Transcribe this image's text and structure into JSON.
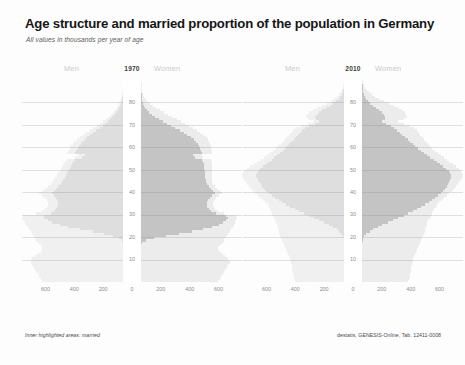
{
  "header": {
    "title": "Age structure and married proportion of the population in Germany",
    "subtitle": "All values in thousands per year of age"
  },
  "footer": {
    "left": "Inner highlighted areas: married",
    "right": "destatis, GENESIS-Online, Tab. 12411-0008"
  },
  "labels": {
    "men": "Men",
    "women": "Women"
  },
  "colors": {
    "total": "#ececec",
    "married": "#c4c4c4",
    "background": "#fdfdfd",
    "title": "#161616",
    "axis_text": "#8e8e8e",
    "header_text": "#c9c9c9"
  },
  "chart_data": [
    {
      "type": "bar",
      "title": "1970",
      "panel": "left",
      "orientation": "population-pyramid",
      "xlabel": "",
      "ylabel": "",
      "xlim": [
        -700,
        700
      ],
      "ylim": [
        0,
        90
      ],
      "grid": true,
      "legend_position": "top",
      "xticks": [
        "600",
        "400",
        "200",
        "0",
        "200",
        "400",
        "600"
      ],
      "xtick_values": [
        -600,
        -400,
        -200,
        0,
        200,
        400,
        600
      ],
      "yticks": [
        "10",
        "20",
        "30",
        "40",
        "50",
        "60",
        "70",
        "80"
      ],
      "ytick_values": [
        10,
        20,
        30,
        40,
        50,
        60,
        70,
        80
      ],
      "series": [
        {
          "name": "Men total",
          "side": "left",
          "values": [
            560,
            570,
            580,
            590,
            600,
            610,
            620,
            630,
            640,
            640,
            630,
            610,
            590,
            570,
            560,
            560,
            570,
            590,
            600,
            610,
            620,
            630,
            640,
            650,
            660,
            670,
            680,
            690,
            700,
            690,
            600,
            560,
            540,
            530,
            520,
            520,
            530,
            540,
            560,
            580,
            560,
            540,
            520,
            500,
            490,
            480,
            470,
            460,
            450,
            440,
            430,
            420,
            410,
            400,
            390,
            330,
            310,
            390,
            380,
            370,
            360,
            350,
            340,
            320,
            300,
            280,
            255,
            230,
            205,
            180,
            160,
            140,
            120,
            100,
            85,
            70,
            56,
            44,
            34,
            26,
            19,
            14,
            10,
            7,
            5,
            3,
            2,
            1,
            1,
            0
          ]
        },
        {
          "name": "Men married",
          "side": "left",
          "values": [
            0,
            0,
            0,
            0,
            0,
            0,
            0,
            0,
            0,
            0,
            0,
            0,
            0,
            0,
            0,
            0,
            0,
            2,
            10,
            30,
            70,
            130,
            210,
            300,
            380,
            440,
            490,
            520,
            545,
            550,
            500,
            480,
            465,
            455,
            450,
            450,
            458,
            465,
            480,
            495,
            480,
            465,
            450,
            432,
            422,
            414,
            405,
            396,
            387,
            378,
            370,
            362,
            353,
            344,
            336,
            284,
            266,
            334,
            324,
            314,
            304,
            294,
            284,
            266,
            248,
            230,
            206,
            184,
            161,
            140,
            123,
            106,
            89,
            73,
            60,
            48,
            37,
            28,
            21,
            15,
            10,
            7,
            5,
            3,
            2,
            1,
            1,
            0,
            0,
            0
          ]
        },
        {
          "name": "Women total",
          "side": "right",
          "values": [
            535,
            545,
            555,
            565,
            575,
            585,
            595,
            605,
            615,
            615,
            605,
            585,
            565,
            545,
            535,
            535,
            545,
            565,
            575,
            585,
            595,
            605,
            615,
            625,
            635,
            645,
            650,
            660,
            665,
            655,
            575,
            535,
            515,
            505,
            500,
            500,
            510,
            520,
            540,
            560,
            545,
            530,
            515,
            500,
            495,
            492,
            490,
            490,
            490,
            490,
            490,
            490,
            490,
            490,
            488,
            430,
            420,
            495,
            492,
            488,
            484,
            480,
            474,
            462,
            448,
            432,
            410,
            386,
            360,
            332,
            305,
            277,
            248,
            218,
            190,
            160,
            132,
            106,
            82,
            62,
            45,
            32,
            22,
            14,
            9,
            6,
            3,
            2,
            1,
            0
          ]
        },
        {
          "name": "Women married",
          "side": "right",
          "values": [
            0,
            0,
            0,
            0,
            0,
            0,
            0,
            0,
            0,
            0,
            0,
            0,
            0,
            0,
            0,
            0,
            0,
            8,
            35,
            90,
            170,
            260,
            350,
            430,
            490,
            540,
            570,
            590,
            600,
            592,
            520,
            485,
            468,
            460,
            456,
            457,
            466,
            476,
            494,
            512,
            498,
            484,
            470,
            456,
            451,
            448,
            446,
            445,
            444,
            442,
            440,
            437,
            434,
            430,
            425,
            372,
            361,
            423,
            417,
            410,
            402,
            394,
            384,
            366,
            346,
            322,
            296,
            268,
            238,
            208,
            180,
            152,
            126,
            100,
            78,
            58,
            40,
            27,
            18,
            11,
            7,
            4,
            2,
            1,
            0,
            0,
            0,
            0,
            0,
            0
          ]
        }
      ]
    },
    {
      "type": "bar",
      "title": "2010",
      "panel": "right",
      "orientation": "population-pyramid",
      "xlabel": "",
      "ylabel": "",
      "xlim": [
        -700,
        700
      ],
      "ylim": [
        0,
        90
      ],
      "grid": true,
      "legend_position": "top",
      "xticks": [
        "600",
        "400",
        "200",
        "0",
        "200",
        "400",
        "600"
      ],
      "xtick_values": [
        -600,
        -400,
        -200,
        0,
        200,
        400,
        600
      ],
      "yticks": [
        "10",
        "20",
        "30",
        "40",
        "50",
        "60",
        "70",
        "80"
      ],
      "ytick_values": [
        10,
        20,
        30,
        40,
        50,
        60,
        70,
        80
      ],
      "series": [
        {
          "name": "Men total",
          "side": "left",
          "values": [
            340,
            345,
            350,
            352,
            355,
            358,
            360,
            362,
            365,
            368,
            372,
            378,
            385,
            392,
            400,
            408,
            415,
            422,
            430,
            436,
            442,
            448,
            452,
            455,
            458,
            462,
            468,
            475,
            482,
            490,
            498,
            505,
            512,
            520,
            530,
            545,
            560,
            578,
            596,
            614,
            632,
            648,
            660,
            672,
            682,
            690,
            700,
            705,
            700,
            690,
            672,
            650,
            625,
            600,
            578,
            556,
            534,
            512,
            490,
            470,
            455,
            440,
            425,
            410,
            396,
            382,
            368,
            352,
            330,
            300,
            250,
            215,
            248,
            262,
            255,
            240,
            215,
            185,
            152,
            120,
            92,
            68,
            48,
            33,
            21,
            13,
            7,
            4,
            2,
            1
          ]
        },
        {
          "name": "Men married",
          "side": "left",
          "values": [
            0,
            0,
            0,
            0,
            0,
            0,
            0,
            0,
            0,
            0,
            0,
            0,
            0,
            0,
            0,
            0,
            0,
            0,
            1,
            3,
            8,
            18,
            33,
            52,
            76,
            104,
            136,
            170,
            205,
            240,
            276,
            310,
            342,
            372,
            400,
            428,
            452,
            478,
            500,
            520,
            540,
            556,
            568,
            578,
            588,
            596,
            604,
            608,
            604,
            596,
            580,
            562,
            540,
            520,
            500,
            482,
            462,
            442,
            424,
            406,
            392,
            378,
            364,
            350,
            336,
            322,
            308,
            292,
            272,
            244,
            200,
            170,
            192,
            198,
            190,
            175,
            152,
            126,
            100,
            76,
            55,
            38,
            25,
            15,
            9,
            5,
            2,
            1,
            1,
            0
          ]
        },
        {
          "name": "Women total",
          "side": "right",
          "values": [
            322,
            328,
            332,
            335,
            338,
            340,
            343,
            345,
            348,
            352,
            356,
            362,
            368,
            375,
            382,
            390,
            398,
            405,
            412,
            418,
            424,
            430,
            434,
            438,
            442,
            447,
            453,
            460,
            468,
            476,
            484,
            492,
            500,
            510,
            520,
            536,
            552,
            570,
            588,
            606,
            624,
            640,
            652,
            664,
            674,
            683,
            692,
            698,
            694,
            686,
            670,
            650,
            628,
            606,
            586,
            566,
            546,
            526,
            506,
            488,
            474,
            460,
            446,
            432,
            418,
            404,
            392,
            378,
            360,
            336,
            288,
            252,
            292,
            312,
            308,
            298,
            278,
            252,
            220,
            186,
            152,
            120,
            92,
            68,
            48,
            32,
            20,
            12,
            6,
            3
          ]
        },
        {
          "name": "Women married",
          "side": "right",
          "values": [
            0,
            0,
            0,
            0,
            0,
            0,
            0,
            0,
            0,
            0,
            0,
            0,
            0,
            0,
            0,
            0,
            0,
            0,
            2,
            6,
            15,
            30,
            52,
            78,
            108,
            142,
            178,
            215,
            252,
            288,
            322,
            354,
            382,
            410,
            436,
            462,
            486,
            508,
            528,
            546,
            562,
            576,
            586,
            594,
            602,
            608,
            614,
            616,
            610,
            600,
            582,
            562,
            540,
            518,
            496,
            474,
            452,
            430,
            408,
            388,
            370,
            352,
            334,
            316,
            298,
            280,
            262,
            244,
            224,
            202,
            168,
            142,
            158,
            160,
            152,
            138,
            120,
            100,
            78,
            58,
            42,
            30,
            20,
            13,
            8,
            4,
            2,
            1,
            0,
            0
          ]
        }
      ]
    }
  ]
}
